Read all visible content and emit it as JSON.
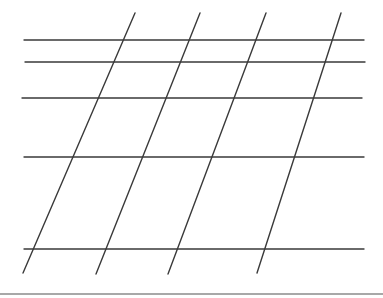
{
  "diagram": {
    "type": "line-grid",
    "stroke_color": "#3a3a3a",
    "stroke_width": 1.4,
    "horizontal_lines": [
      {
        "y": 40,
        "x1": 24,
        "x2": 364
      },
      {
        "y": 62,
        "x1": 25,
        "x2": 365
      },
      {
        "y": 98,
        "x1": 22,
        "x2": 362
      },
      {
        "y": 157,
        "x1": 24,
        "x2": 364
      },
      {
        "y": 249,
        "x1": 24,
        "x2": 364
      }
    ],
    "slanted_lines": [
      {
        "x1": 135,
        "y1": 13,
        "x2": 23,
        "y2": 273
      },
      {
        "x1": 200,
        "y1": 13,
        "x2": 96,
        "y2": 274
      },
      {
        "x1": 266,
        "y1": 13,
        "x2": 168,
        "y2": 274
      },
      {
        "x1": 341,
        "y1": 13,
        "x2": 257,
        "y2": 273
      }
    ],
    "bottom_rule_color": "#a8a8a8"
  }
}
